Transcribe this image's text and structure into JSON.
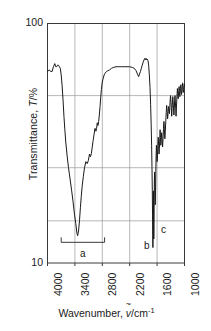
{
  "chart_data": {
    "type": "line",
    "title": "",
    "xlabel": "Wavenumber, v/cm-1",
    "ylabel": "Transmittance, T/%",
    "xlabel_parts": {
      "prefix": "Wavenumber, ",
      "symbol": "v",
      "tilde": "~",
      "unit": "/cm",
      "exponent": "-1"
    },
    "ylabel_parts": {
      "prefix": "Transmittance, ",
      "symbol": "T",
      "unit": "/%"
    },
    "xlim": [
      4000,
      1000
    ],
    "ylim": [
      10,
      100
    ],
    "yscale": "log",
    "xscale": "linear",
    "x_inverted": true,
    "grid": true,
    "legend": false,
    "xticks": [
      4000,
      3400,
      2800,
      2200,
      1600,
      1000
    ],
    "xtick_labels": [
      "4000",
      "3400",
      "2800",
      "2200",
      "1600",
      "1000"
    ],
    "yticks": [
      100,
      10
    ],
    "ytick_labels": [
      "100",
      "10"
    ],
    "y_gridlines": [
      50,
      25,
      15
    ],
    "annotations": [
      {
        "label": "a",
        "x": 3200,
        "y": 12.2,
        "type": "bracket",
        "x_start": 3700,
        "x_end": 2750
      },
      {
        "label": "b",
        "x": 1700,
        "y": 12.0,
        "type": "text"
      },
      {
        "label": "c",
        "x": 1480,
        "y": 14.5,
        "type": "text"
      }
    ],
    "series": [
      {
        "name": "IR transmittance spectrum",
        "points": [
          [
            4000,
            63
          ],
          [
            3960,
            64
          ],
          [
            3930,
            63
          ],
          [
            3900,
            63
          ],
          [
            3870,
            66
          ],
          [
            3840,
            68
          ],
          [
            3820,
            66
          ],
          [
            3800,
            66
          ],
          [
            3780,
            67
          ],
          [
            3760,
            67
          ],
          [
            3740,
            66
          ],
          [
            3720,
            65
          ],
          [
            3700,
            61
          ],
          [
            3680,
            55
          ],
          [
            3660,
            48
          ],
          [
            3640,
            41
          ],
          [
            3620,
            36
          ],
          [
            3600,
            32
          ],
          [
            3570,
            28
          ],
          [
            3540,
            25
          ],
          [
            3500,
            22
          ],
          [
            3470,
            20
          ],
          [
            3440,
            18
          ],
          [
            3410,
            16
          ],
          [
            3380,
            14.6
          ],
          [
            3355,
            13.3
          ],
          [
            3340,
            13.0
          ],
          [
            3320,
            13.6
          ],
          [
            3300,
            15.0
          ],
          [
            3280,
            17
          ],
          [
            3260,
            19
          ],
          [
            3240,
            21
          ],
          [
            3215,
            23
          ],
          [
            3190,
            25
          ],
          [
            3160,
            26.5
          ],
          [
            3130,
            26.0
          ],
          [
            3105,
            26.8
          ],
          [
            3080,
            28.5
          ],
          [
            3060,
            27.8
          ],
          [
            3040,
            28.6
          ],
          [
            3020,
            30.5
          ],
          [
            3000,
            32.5
          ],
          [
            2980,
            34.5
          ],
          [
            2960,
            36.5
          ],
          [
            2940,
            35.5
          ],
          [
            2925,
            36.5
          ],
          [
            2910,
            38.5
          ],
          [
            2895,
            37.5
          ],
          [
            2880,
            39.0
          ],
          [
            2865,
            41.5
          ],
          [
            2850,
            45
          ],
          [
            2835,
            49
          ],
          [
            2820,
            53
          ],
          [
            2800,
            57
          ],
          [
            2780,
            59
          ],
          [
            2760,
            61
          ],
          [
            2740,
            62
          ],
          [
            2710,
            63
          ],
          [
            2680,
            63.5
          ],
          [
            2640,
            64
          ],
          [
            2600,
            65
          ],
          [
            2560,
            65.5
          ],
          [
            2500,
            66
          ],
          [
            2440,
            66
          ],
          [
            2380,
            66
          ],
          [
            2320,
            66
          ],
          [
            2260,
            66
          ],
          [
            2200,
            66
          ],
          [
            2140,
            65.5
          ],
          [
            2100,
            65
          ],
          [
            2060,
            63.5
          ],
          [
            2030,
            61.5
          ],
          [
            2005,
            60
          ],
          [
            1985,
            61.5
          ],
          [
            1965,
            63
          ],
          [
            1945,
            65
          ],
          [
            1925,
            67
          ],
          [
            1905,
            69
          ],
          [
            1885,
            70.5
          ],
          [
            1870,
            71.5
          ],
          [
            1855,
            70.5
          ],
          [
            1840,
            71.5
          ],
          [
            1825,
            70.5
          ],
          [
            1812,
            71
          ],
          [
            1800,
            70
          ],
          [
            1785,
            67
          ],
          [
            1770,
            61
          ],
          [
            1755,
            54
          ],
          [
            1742,
            46
          ],
          [
            1730,
            38
          ],
          [
            1720,
            31
          ],
          [
            1712,
            25
          ],
          [
            1705,
            20
          ],
          [
            1700,
            16
          ],
          [
            1696,
            13
          ],
          [
            1692,
            11.6
          ],
          [
            1688,
            13.5
          ],
          [
            1684,
            17
          ],
          [
            1681,
            20
          ],
          [
            1678,
            17.5
          ],
          [
            1675,
            14.5
          ],
          [
            1672,
            12.6
          ],
          [
            1668,
            14.5
          ],
          [
            1664,
            18
          ],
          [
            1660,
            22
          ],
          [
            1655,
            24
          ],
          [
            1650,
            22
          ],
          [
            1645,
            19.5
          ],
          [
            1640,
            17.5
          ],
          [
            1634,
            20
          ],
          [
            1628,
            24
          ],
          [
            1622,
            28
          ],
          [
            1615,
            31
          ],
          [
            1608,
            29
          ],
          [
            1600,
            26.5
          ],
          [
            1592,
            28
          ],
          [
            1584,
            31
          ],
          [
            1575,
            33.5
          ],
          [
            1566,
            31
          ],
          [
            1558,
            28.5
          ],
          [
            1550,
            30
          ],
          [
            1542,
            33
          ],
          [
            1534,
            36
          ],
          [
            1526,
            33.5
          ],
          [
            1518,
            31
          ],
          [
            1510,
            32.5
          ],
          [
            1500,
            35
          ],
          [
            1490,
            33
          ],
          [
            1480,
            30.5
          ],
          [
            1470,
            33
          ],
          [
            1460,
            36.5
          ],
          [
            1450,
            39
          ],
          [
            1440,
            36
          ],
          [
            1430,
            33
          ],
          [
            1420,
            35.5
          ],
          [
            1410,
            39
          ],
          [
            1400,
            42.5
          ],
          [
            1390,
            45.5
          ],
          [
            1380,
            43
          ],
          [
            1370,
            40
          ],
          [
            1360,
            42
          ],
          [
            1350,
            45
          ],
          [
            1340,
            44
          ],
          [
            1330,
            42
          ],
          [
            1322,
            44.5
          ],
          [
            1314,
            48
          ],
          [
            1305,
            50
          ],
          [
            1296,
            47
          ],
          [
            1288,
            44
          ],
          [
            1280,
            41
          ],
          [
            1272,
            44
          ],
          [
            1264,
            47
          ],
          [
            1256,
            49.5
          ],
          [
            1248,
            47
          ],
          [
            1240,
            44
          ],
          [
            1232,
            41.5
          ],
          [
            1224,
            44
          ],
          [
            1216,
            47.5
          ],
          [
            1208,
            50
          ],
          [
            1200,
            47
          ],
          [
            1192,
            44
          ],
          [
            1185,
            41
          ],
          [
            1178,
            44
          ],
          [
            1170,
            47.5
          ],
          [
            1162,
            51
          ],
          [
            1155,
            53.5
          ],
          [
            1148,
            51
          ],
          [
            1140,
            48.5
          ],
          [
            1133,
            50
          ],
          [
            1126,
            52.5
          ],
          [
            1118,
            54.5
          ],
          [
            1110,
            52
          ],
          [
            1102,
            49.5
          ],
          [
            1095,
            51
          ],
          [
            1088,
            53.5
          ],
          [
            1080,
            55.5
          ],
          [
            1072,
            53
          ],
          [
            1065,
            50.5
          ],
          [
            1058,
            52
          ],
          [
            1050,
            54.5
          ],
          [
            1042,
            56.5
          ],
          [
            1035,
            54
          ],
          [
            1028,
            51.5
          ],
          [
            1020,
            53
          ],
          [
            1012,
            55
          ],
          [
            1005,
            56
          ],
          [
            1000,
            55
          ]
        ]
      }
    ]
  }
}
